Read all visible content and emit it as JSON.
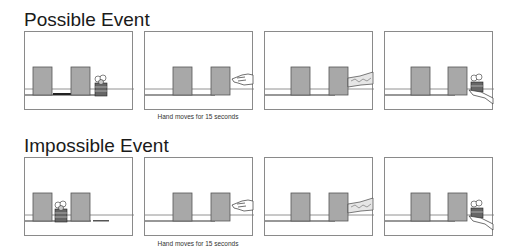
{
  "rows": [
    {
      "title": "Possible Event",
      "caption": "Hand moves for 15 seconds",
      "panels": [
        {
          "label": "toy beside screens",
          "toy": "right-of-screens",
          "hand": "none"
        },
        {
          "label": "hand enters",
          "toy": "none",
          "hand": "open-hand"
        },
        {
          "label": "arm reaches behind screen",
          "toy": "none",
          "hand": "arm"
        },
        {
          "label": "hand retrieves toy",
          "toy": "in-hand",
          "hand": "holding"
        }
      ]
    },
    {
      "title": "Impossible Event",
      "caption": "Hand moves for 15 seconds",
      "panels": [
        {
          "label": "toy between screens",
          "toy": "between-screens",
          "hand": "none"
        },
        {
          "label": "hand enters",
          "toy": "none",
          "hand": "open-hand"
        },
        {
          "label": "arm reaches behind screen",
          "toy": "none",
          "hand": "arm"
        },
        {
          "label": "hand retrieves toy",
          "toy": "in-hand",
          "hand": "holding"
        }
      ]
    }
  ],
  "colors": {
    "screen_fill": "#a8a8a8",
    "screen_border": "#555555",
    "frame": "#8a8a8a",
    "track": "#444444"
  }
}
